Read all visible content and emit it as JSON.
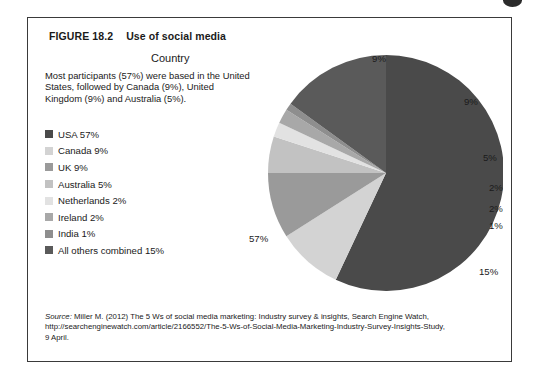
{
  "figure": {
    "number": "FIGURE 18.2",
    "title": "Use of social media",
    "heading": "Country",
    "blurb": "Most participants (57%) were based in the United States, followed by Canada (9%), United Kingdom (9%) and Australia (5%).",
    "source_word": "Source:",
    "source_line1": " Miller M. (2012) The 5 Ws of social media marketing: Industry survey & insights, Search Engine Watch,",
    "source_line2": "http://searchenginewatch.com/article/2166552/The-5-Ws-of-Social-Media-Marketing-Industry-Survey-Insights-Study,",
    "source_line3": "9 April."
  },
  "legend": [
    {
      "label": "USA 57%",
      "color": "#4a4a4a"
    },
    {
      "label": "Canada 9%",
      "color": "#d3d3d3"
    },
    {
      "label": "UK 9%",
      "color": "#9a9a9a"
    },
    {
      "label": "Australia 5%",
      "color": "#c2c2c2"
    },
    {
      "label": "Netherlands 2%",
      "color": "#e2e2e2"
    },
    {
      "label": "Ireland 2%",
      "color": "#a8a8a8"
    },
    {
      "label": "India 1%",
      "color": "#8e8e8e"
    },
    {
      "label": "All others combined 15%",
      "color": "#5a5a5a"
    }
  ],
  "chart_data": {
    "type": "pie",
    "title": "Use of social media",
    "xlabel": "",
    "ylabel": "",
    "legend_position": "left",
    "grid": false,
    "categories": [
      "USA",
      "Canada",
      "UK",
      "Australia",
      "Netherlands",
      "Ireland",
      "India",
      "All others combined"
    ],
    "values": [
      57,
      9,
      9,
      5,
      2,
      2,
      1,
      15
    ],
    "colors": [
      "#4a4a4a",
      "#d3d3d3",
      "#9a9a9a",
      "#c2c2c2",
      "#e2e2e2",
      "#a8a8a8",
      "#8e8e8e",
      "#5a5a5a"
    ],
    "data_labels": [
      "57%",
      "9%",
      "9%",
      "5%",
      "2%",
      "2%",
      "1%",
      "15%"
    ],
    "start_angle_deg": -90,
    "direction": "clockwise",
    "units": "percent"
  },
  "labels": {
    "canada": "9%",
    "uk": "9%",
    "australia": "5%",
    "netherlands": "2%",
    "ireland": "2%",
    "india": "1%",
    "others": "15%",
    "usa": "57%"
  }
}
